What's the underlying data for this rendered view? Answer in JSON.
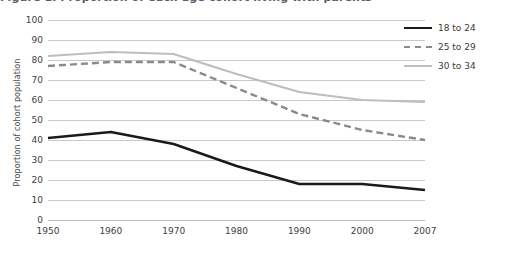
{
  "chart_data": {
    "type": "line",
    "title": "Figure 1. Proportion of each age cohort living with parents",
    "xlabel": "",
    "ylabel": "Proportion of cohort population",
    "categories": [
      "1950",
      "1960",
      "1970",
      "1980",
      "1990",
      "2000",
      "2007"
    ],
    "ylim": [
      0,
      100
    ],
    "ytick_labels": [
      "0",
      "10",
      "20",
      "30",
      "40",
      "50",
      "60",
      "70",
      "80",
      "90",
      "100"
    ],
    "ytick_values": [
      0,
      10,
      20,
      30,
      40,
      50,
      60,
      70,
      80,
      90,
      100
    ],
    "grid": true,
    "legend_position": "top-right",
    "series": [
      {
        "name": "18 to 24",
        "style": "solid",
        "color": "#1a1a1a",
        "width": 2.4,
        "values": [
          41,
          44,
          38,
          27,
          18,
          18,
          15
        ]
      },
      {
        "name": "25 to 29",
        "style": "dashed",
        "color": "#8a8a8a",
        "width": 2.4,
        "values": [
          77,
          79,
          79,
          66,
          53,
          45,
          40
        ]
      },
      {
        "name": "30 to 34",
        "style": "solid",
        "color": "#bdbdbd",
        "width": 2.2,
        "values": [
          82,
          84,
          83,
          73,
          64,
          60,
          59
        ]
      }
    ]
  },
  "legend": {
    "items": [
      {
        "label": "18 to 24"
      },
      {
        "label": "25 to 29"
      },
      {
        "label": "30 to 34"
      }
    ]
  },
  "colors": {
    "series_18_24": "#1a1a1a",
    "series_25_29": "#8a8a8a",
    "series_30_34": "#bdbdbd",
    "gridline": "#c8c8c8",
    "text": "#3a3a3a",
    "background": "#ffffff"
  }
}
